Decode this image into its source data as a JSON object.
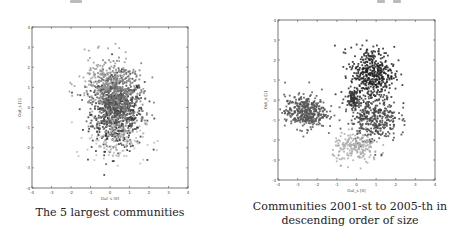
{
  "figure": {
    "panels": [
      {
        "id": "left",
        "caption": "The 5 largest communities",
        "xlabel": "Out_s [0]",
        "ylabel": "Out_s [1]"
      },
      {
        "id": "right",
        "caption_line1": "Communities 2001-st to 2005-th in",
        "caption_line2": "descending order of size",
        "xlabel": "Out_s [0]",
        "ylabel": "Out_s [1]"
      }
    ]
  },
  "chart_data": [
    {
      "type": "scatter",
      "title": "The 5 largest communities",
      "xlabel": "Out_s [0]",
      "ylabel": "Out_s [1]",
      "xlim": [
        -4,
        4
      ],
      "ylim": [
        -4,
        4
      ],
      "xticks": [
        -4,
        -3,
        -2,
        -1,
        0,
        1,
        2,
        3,
        4
      ],
      "yticks": [
        -4,
        -3,
        -2,
        -1,
        0,
        1,
        2,
        3,
        4
      ],
      "grid": false,
      "legend": null,
      "series": [
        {
          "name": "community 1",
          "color": "#333333",
          "center": [
            0.4,
            -0.3
          ],
          "spread": [
            0.9,
            1.2
          ],
          "n": 500
        },
        {
          "name": "community 2",
          "color": "#555555",
          "center": [
            0.1,
            0.2
          ],
          "spread": [
            0.7,
            1.0
          ],
          "n": 400
        },
        {
          "name": "community 3",
          "color": "#777777",
          "center": [
            0.6,
            0.5
          ],
          "spread": [
            0.8,
            1.1
          ],
          "n": 300
        },
        {
          "name": "community 4",
          "color": "#999999",
          "center": [
            -0.3,
            1.2
          ],
          "spread": [
            0.9,
            0.9
          ],
          "n": 200
        },
        {
          "name": "community 5",
          "color": "#bbbbbb",
          "center": [
            0.3,
            -1.5
          ],
          "spread": [
            1.0,
            0.8
          ],
          "n": 150
        }
      ]
    },
    {
      "type": "scatter",
      "title": "Communities 2001-st to 2005-th in descending order of size",
      "xlabel": "Out_s [0]",
      "ylabel": "Out_s [1]",
      "xlim": [
        -4,
        4
      ],
      "ylim": [
        -4,
        4
      ],
      "xticks": [
        -4,
        -3,
        -2,
        -1,
        0,
        1,
        2,
        3,
        4
      ],
      "yticks": [
        -4,
        -3,
        -2,
        -1,
        0,
        1,
        2,
        3,
        4
      ],
      "grid": false,
      "legend": null,
      "series": [
        {
          "name": "community 2001",
          "color": "#222222",
          "center": [
            0.8,
            1.3
          ],
          "spread": [
            0.75,
            0.9
          ],
          "n": 450
        },
        {
          "name": "community 2002",
          "color": "#555555",
          "center": [
            -2.6,
            -0.6
          ],
          "spread": [
            0.7,
            0.55
          ],
          "n": 400
        },
        {
          "name": "community 2003",
          "color": "#444444",
          "center": [
            0.9,
            -0.9
          ],
          "spread": [
            0.8,
            0.8
          ],
          "n": 350
        },
        {
          "name": "community 2004",
          "color": "#aaaaaa",
          "center": [
            0.0,
            -2.4
          ],
          "spread": [
            0.8,
            0.5
          ],
          "n": 200
        },
        {
          "name": "community 2005",
          "color": "#333333",
          "center": [
            -0.2,
            0.1
          ],
          "spread": [
            0.25,
            0.3
          ],
          "n": 80
        }
      ]
    }
  ]
}
